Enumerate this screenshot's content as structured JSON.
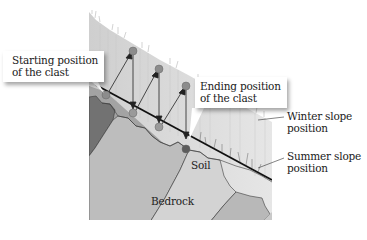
{
  "figure": {
    "labels": {
      "starting_position": [
        "Starting position",
        "of the clast"
      ],
      "ending_position": [
        "Ending position",
        "of the clast"
      ],
      "winter_slope": [
        "Winter slope",
        "position"
      ],
      "summer_slope": [
        "Summer slope",
        "position"
      ],
      "soil": "Soil",
      "bedrock": "Bedrock"
    },
    "colors": {
      "snow_layer": "#d9d9d9",
      "soil": "#9a9a9a",
      "bedrock_light": "#c8c8c8",
      "bedrock_mid": "#b0b0b0",
      "bedrock_dark": "#6e6e6e",
      "clast": "#8a8a8a",
      "clast_end": "#5a5a5a",
      "slope_line": "#111111",
      "arrow": "#222222"
    },
    "clasts": {
      "surface_positions": [
        [
          133,
          51
        ],
        [
          159,
          69
        ],
        [
          186,
          86
        ]
      ],
      "lowered_positions": [
        [
          133,
          113
        ],
        [
          159,
          127
        ],
        [
          186,
          141
        ]
      ],
      "start_position": [
        106,
        95
      ],
      "end_position": [
        186,
        149
      ]
    }
  }
}
